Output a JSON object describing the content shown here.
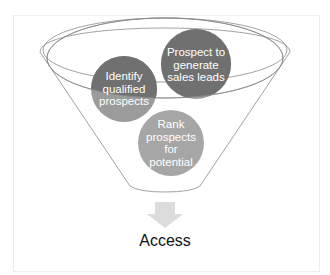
{
  "diagram": {
    "type": "funnel",
    "stages": [
      {
        "id": "identify",
        "label": "Identify qualified prospects",
        "lines": [
          "Identify",
          "qualified",
          "prospects"
        ]
      },
      {
        "id": "prospect",
        "label": "Prospect to generate sales leads",
        "lines": [
          "Prospect to",
          "generate",
          "sales leads"
        ]
      },
      {
        "id": "rank",
        "label": "Rank prospects for potential",
        "lines": [
          "Rank",
          "prospects",
          "for",
          "potential"
        ]
      }
    ],
    "output": {
      "label": "Access"
    },
    "colors": {
      "circle_dark": "#737373",
      "circle_light": "#a6a6a6",
      "funnel_stroke": "#8a8a8a",
      "arrow": "#d9d9d9",
      "text": "#111111"
    }
  }
}
